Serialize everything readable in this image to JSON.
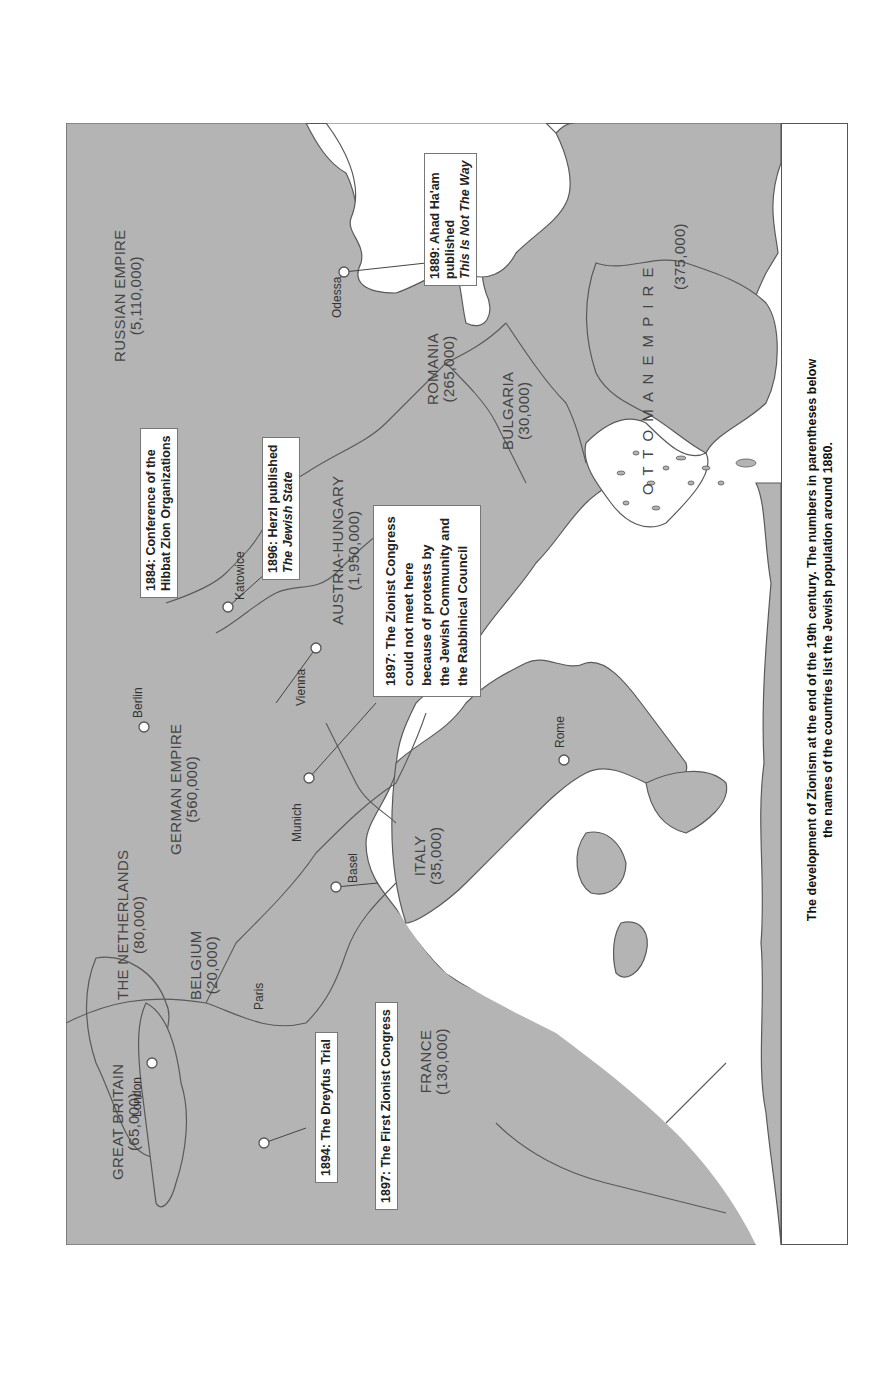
{
  "map": {
    "caption": {
      "line1": "The development of Zionism at the end of the 19th century. The numbers in parentheses below",
      "line2": "the names of the countries list the Jewish population around 1880."
    },
    "countries": [
      {
        "id": "great-britain",
        "name": "GREAT BRITAIN",
        "population": "(65,000)"
      },
      {
        "id": "the-netherlands",
        "name": "THE NETHERLANDS",
        "population": "(80,000)"
      },
      {
        "id": "belgium",
        "name": "BELGIUM",
        "population": "(20,000)"
      },
      {
        "id": "france",
        "name": "FRANCE",
        "population": "(130,000)"
      },
      {
        "id": "german-empire",
        "name": "GERMAN EMPIRE",
        "population": "(560,000)"
      },
      {
        "id": "italy",
        "name": "ITALY",
        "population": "(35,000)"
      },
      {
        "id": "austria-hungary",
        "name": "AUSTRIA-HUNGARY",
        "population": "(1,950,000)"
      },
      {
        "id": "russian-empire",
        "name": "RUSSIAN EMPIRE",
        "population": "(5,110,000)"
      },
      {
        "id": "romania",
        "name": "ROMANIA",
        "population": "(265,000)"
      },
      {
        "id": "bulgaria",
        "name": "BULGARIA",
        "population": "(30,000)"
      },
      {
        "id": "ottoman-empire",
        "name": "O T T O M A N   E M P I R E",
        "population": "(375,000)"
      }
    ],
    "cities": [
      {
        "id": "london",
        "name": "London"
      },
      {
        "id": "paris",
        "name": "Paris"
      },
      {
        "id": "berlin",
        "name": "Berlin"
      },
      {
        "id": "munich",
        "name": "Munich"
      },
      {
        "id": "basel",
        "name": "Basel"
      },
      {
        "id": "vienna",
        "name": "Vienna"
      },
      {
        "id": "katowice",
        "name": "Katowice"
      },
      {
        "id": "odessa",
        "name": "Odessa"
      },
      {
        "id": "rome",
        "name": "Rome"
      }
    ],
    "callouts": {
      "dreyfus": {
        "text": "1894: The Dreyfus Trial"
      },
      "first_congress": {
        "text": "1897: The First Zionist Congress"
      },
      "hibbat": {
        "line1": "1884:  Conference of the",
        "line2": "Hibbat Zion Organizations"
      },
      "herzl": {
        "line1": "1896: Herzl published",
        "line2": "The Jewish State"
      },
      "munich": {
        "line1": "1897: The Zionist Congress",
        "line2": "could not meet here",
        "line3": "because of protests by",
        "line4": "the Jewish Community and",
        "line5": "the Rabbinical Council"
      },
      "ahad": {
        "line1": "1889: Ahad Ha'am",
        "line2": "published",
        "line3": "This Is Not The Way"
      }
    }
  }
}
